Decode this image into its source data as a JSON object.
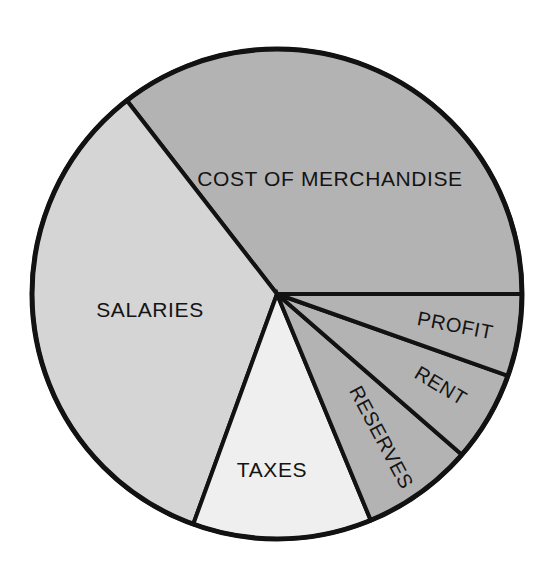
{
  "chart_data": {
    "type": "pie",
    "title": "",
    "subtitle": "",
    "xlabel": "",
    "ylabel": "",
    "legend_position": "none",
    "grid": false,
    "units": "percent of sales dollar",
    "center": {
      "x": 277,
      "y": 294
    },
    "radius": 245,
    "slices": [
      {
        "label": "COST OF MERCHANDISE",
        "value": 35.5,
        "color": "#b3b3b3",
        "start_angle": 0,
        "end_angle": 127.8,
        "label_x": 330,
        "label_y": 180,
        "label_rotation": 0
      },
      {
        "label": "SALARIES",
        "value": 33.9,
        "color": "#d5d5d5",
        "start_angle": 127.8,
        "end_angle": 250.0,
        "label_x": 150,
        "label_y": 311,
        "label_rotation": 0
      },
      {
        "label": "TAXES",
        "value": 11.8,
        "color": "#efefef",
        "start_angle": 250.0,
        "end_angle": 292.5,
        "label_x": 272,
        "label_y": 471,
        "label_rotation": 0
      },
      {
        "label": "RESERVES",
        "value": 7.4,
        "color": "#b3b3b3",
        "start_angle": 292.5,
        "end_angle": 319.0,
        "label_x": 380,
        "label_y": 438,
        "label_rotation": 62
      },
      {
        "label": "RENT",
        "value": 6.0,
        "color": "#b3b3b3",
        "start_angle": 319.0,
        "end_angle": 340.5,
        "label_x": 440,
        "label_y": 387,
        "label_rotation": 31
      },
      {
        "label": "PROFIT",
        "value": 5.4,
        "color": "#b3b3b3",
        "start_angle": 340.5,
        "end_angle": 360,
        "label_x": 455,
        "label_y": 327,
        "label_rotation": 11
      }
    ]
  },
  "colors": {
    "outline": "#121212",
    "background": "#ffffff",
    "dark_gray": "#b3b3b3",
    "mid_gray": "#d5d5d5",
    "light_gray": "#efefef"
  }
}
